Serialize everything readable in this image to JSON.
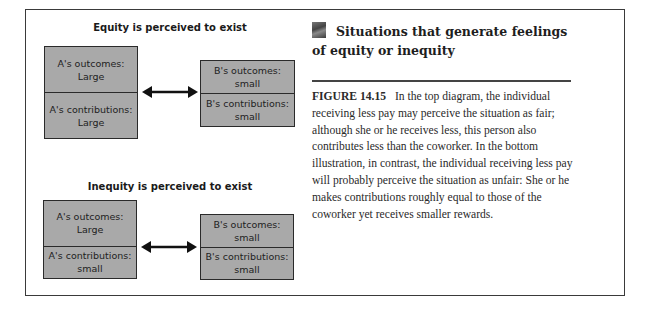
{
  "diagram": {
    "top": {
      "title": "Equity is perceived to exist",
      "a_outcomes": [
        "A's outcomes:",
        "Large"
      ],
      "a_contributions": [
        "A's contributions:",
        "Large"
      ],
      "b_outcomes": [
        "B's outcomes:",
        "small"
      ],
      "b_contributions": [
        "B's contributions:",
        "small"
      ]
    },
    "bottom": {
      "title": "Inequity is perceived to exist",
      "a_outcomes": [
        "A's outcomes:",
        "Large"
      ],
      "a_contributions": [
        "A's contributions:",
        "small"
      ],
      "b_outcomes": [
        "B's outcomes:",
        "small"
      ],
      "b_contributions": [
        "B's contributions:",
        "small"
      ]
    },
    "arrow_icon": "double-headed-arrow",
    "box_fill": "#a9a9a9",
    "border_color": "#2a2a2a"
  },
  "sidebar": {
    "icon": "photo-thumbnail-icon",
    "heading": "Situations that generate feelings of equity or inequity",
    "figure_label": "FIGURE 14.15",
    "caption": "In the top diagram, the individual receiving less pay may perceive the situation as fair; although she or he receives less, this person also contributes less than the coworker. In the bottom illustration, in contrast, the individual receiving less pay will probably perceive the situation as unfair: She or he makes contributions roughly equal to those of the coworker yet receives smaller rewards."
  }
}
